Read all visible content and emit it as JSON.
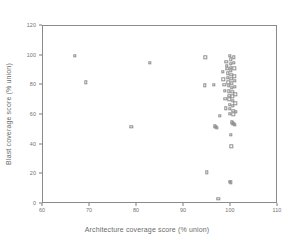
{
  "chart_data": {
    "type": "scatter",
    "title": "",
    "xlabel": "Architecture coverage score (% union)",
    "ylabel": "Blast coverage score (% union)",
    "xlim": [
      60,
      110
    ],
    "ylim": [
      0,
      120
    ],
    "xticks": [
      60,
      70,
      80,
      90,
      100,
      110
    ],
    "yticks": [
      0,
      20,
      40,
      60,
      80,
      100,
      120
    ],
    "grid": false,
    "legend": null,
    "marker": "open-square",
    "marker_color": "#8f8f8f",
    "frame_color": "#8a8a8a",
    "points": [
      {
        "x": 66.8,
        "y": 100.0
      },
      {
        "x": 69.1,
        "y": 82.0
      },
      {
        "x": 78.8,
        "y": 52.0
      },
      {
        "x": 82.7,
        "y": 95.0
      },
      {
        "x": 94.5,
        "y": 99.0
      },
      {
        "x": 94.4,
        "y": 80.0
      },
      {
        "x": 94.9,
        "y": 21.5
      },
      {
        "x": 96.3,
        "y": 80.5
      },
      {
        "x": 96.6,
        "y": 52.5
      },
      {
        "x": 96.8,
        "y": 52.0
      },
      {
        "x": 97.0,
        "y": 51.5
      },
      {
        "x": 97.3,
        "y": 3.5
      },
      {
        "x": 97.6,
        "y": 59.5
      },
      {
        "x": 98.3,
        "y": 89.0
      },
      {
        "x": 98.4,
        "y": 84.0
      },
      {
        "x": 98.6,
        "y": 80.5
      },
      {
        "x": 98.7,
        "y": 76.5
      },
      {
        "x": 98.8,
        "y": 71.0
      },
      {
        "x": 98.9,
        "y": 64.5
      },
      {
        "x": 99.0,
        "y": 96.0
      },
      {
        "x": 99.1,
        "y": 93.0
      },
      {
        "x": 99.2,
        "y": 91.0
      },
      {
        "x": 99.3,
        "y": 88.0
      },
      {
        "x": 99.3,
        "y": 85.0
      },
      {
        "x": 99.4,
        "y": 82.0
      },
      {
        "x": 99.5,
        "y": 79.5
      },
      {
        "x": 99.5,
        "y": 76.0
      },
      {
        "x": 99.6,
        "y": 73.0
      },
      {
        "x": 99.6,
        "y": 70.5
      },
      {
        "x": 99.7,
        "y": 67.0
      },
      {
        "x": 99.7,
        "y": 64.0
      },
      {
        "x": 99.8,
        "y": 61.0
      },
      {
        "x": 99.8,
        "y": 100.0
      },
      {
        "x": 99.9,
        "y": 97.5
      },
      {
        "x": 99.9,
        "y": 94.5
      },
      {
        "x": 100.0,
        "y": 92.0
      },
      {
        "x": 100.0,
        "y": 90.0
      },
      {
        "x": 100.1,
        "y": 87.0
      },
      {
        "x": 100.1,
        "y": 84.5
      },
      {
        "x": 100.2,
        "y": 81.5
      },
      {
        "x": 100.2,
        "y": 78.5
      },
      {
        "x": 100.3,
        "y": 75.5
      },
      {
        "x": 100.3,
        "y": 72.5
      },
      {
        "x": 100.4,
        "y": 69.5
      },
      {
        "x": 100.4,
        "y": 66.0
      },
      {
        "x": 100.5,
        "y": 63.0
      },
      {
        "x": 100.5,
        "y": 60.5
      },
      {
        "x": 100.6,
        "y": 99.0
      },
      {
        "x": 100.6,
        "y": 95.0
      },
      {
        "x": 100.7,
        "y": 91.5
      },
      {
        "x": 100.7,
        "y": 86.0
      },
      {
        "x": 100.8,
        "y": 83.0
      },
      {
        "x": 100.8,
        "y": 79.0
      },
      {
        "x": 100.9,
        "y": 74.0
      },
      {
        "x": 100.9,
        "y": 68.0
      },
      {
        "x": 101.0,
        "y": 62.0
      },
      {
        "x": 100.2,
        "y": 55.0
      },
      {
        "x": 100.4,
        "y": 54.5
      },
      {
        "x": 100.6,
        "y": 54.0
      },
      {
        "x": 100.8,
        "y": 53.5
      },
      {
        "x": 99.9,
        "y": 46.5
      },
      {
        "x": 100.1,
        "y": 39.0
      },
      {
        "x": 99.8,
        "y": 15.0
      },
      {
        "x": 100.0,
        "y": 14.5
      }
    ]
  }
}
